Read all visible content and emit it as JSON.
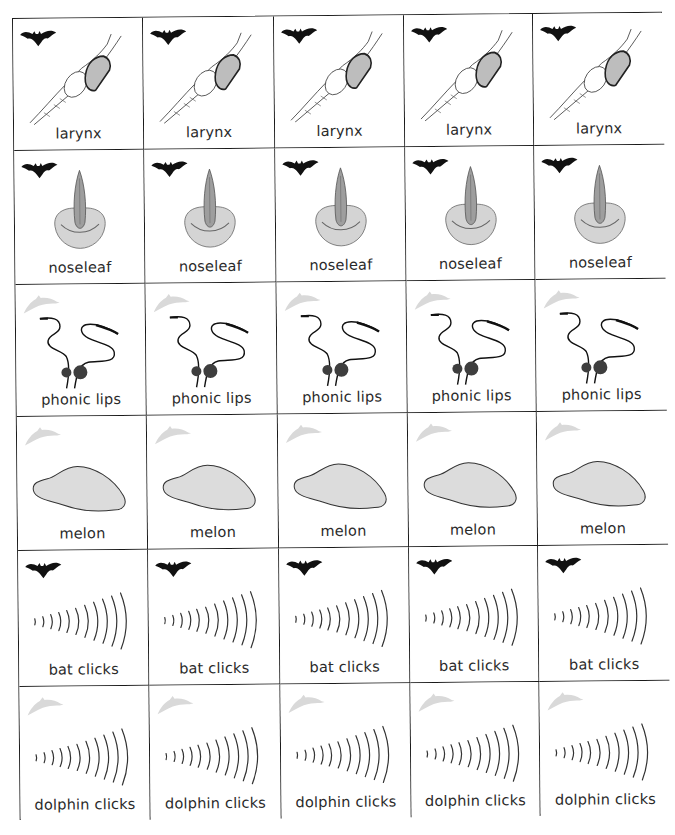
{
  "sheet": {
    "columns": 5,
    "rows": [
      {
        "id": "larynx",
        "label": "larynx",
        "animal": "bat-icon",
        "illustration": "larynx-illustration"
      },
      {
        "id": "noseleaf",
        "label": "noseleaf",
        "animal": "bat-icon",
        "illustration": "noseleaf-illustration"
      },
      {
        "id": "phonic-lips",
        "label": "phonic lips",
        "animal": "dolphin-icon",
        "illustration": "phonic-lips-illustration"
      },
      {
        "id": "melon",
        "label": "melon",
        "animal": "dolphin-icon",
        "illustration": "melon-illustration"
      },
      {
        "id": "bat-clicks",
        "label": "bat clicks",
        "animal": "bat-icon",
        "illustration": "sound-waves-illustration"
      },
      {
        "id": "dolphin-clicks",
        "label": "dolphin clicks",
        "animal": "dolphin-icon",
        "illustration": "sound-waves-illustration"
      }
    ]
  },
  "colors": {
    "grid_line": "#1a1a1a",
    "bat": "#111111",
    "dolphin": "#d9d9d9",
    "melon_fill": "#dcdcdc",
    "larynx_fill": "#bdbdbd",
    "noseleaf_fill": "#c8c8c8",
    "text": "#2a2a2a"
  }
}
